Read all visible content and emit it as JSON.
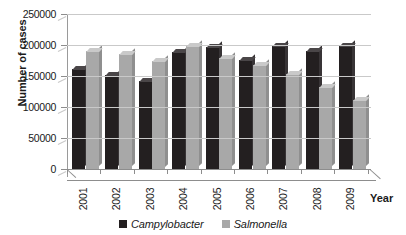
{
  "chart_data": {
    "type": "bar",
    "title": "",
    "subtitle": "",
    "xlabel": "Year",
    "ylabel": "Number of cases",
    "categories": [
      "2001",
      "2002",
      "2003",
      "2004",
      "2005",
      "2006",
      "2007",
      "2008",
      "2009"
    ],
    "series": [
      {
        "name": "Campylobacter",
        "color": "#231f20",
        "values": [
          162000,
          152000,
          142000,
          188000,
          196000,
          176000,
          199000,
          191000,
          198000
        ]
      },
      {
        "name": "Salmonella",
        "color": "#a8a8a8",
        "values": [
          190000,
          186000,
          175000,
          198000,
          179000,
          168000,
          153000,
          133000,
          112000
        ]
      }
    ],
    "ylim": [
      0,
      250000
    ],
    "ytick_values": [
      0,
      50000,
      100000,
      150000,
      200000,
      250000
    ],
    "ytick_labels": [
      "0",
      "50000",
      "100000",
      "150000",
      "200000",
      "250000"
    ],
    "grid": true,
    "legend_position": "bottom",
    "style": "3d-column"
  },
  "axes": {
    "y_title": "Number of cases",
    "x_title": "Year"
  },
  "legend": {
    "items": [
      {
        "label": "Campylobacter",
        "color": "#231f20"
      },
      {
        "label": "Salmonella",
        "color": "#a8a8a8"
      }
    ]
  }
}
